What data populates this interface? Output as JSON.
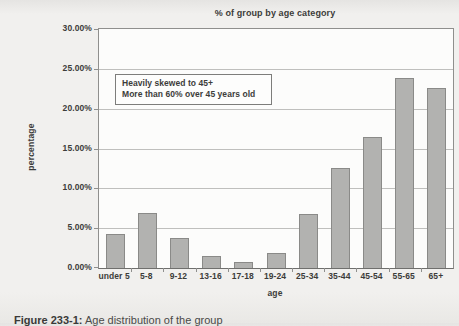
{
  "chart_data": {
    "type": "bar",
    "title": "% of group by age category",
    "xlabel": "age",
    "ylabel": "percentage",
    "categories": [
      "under 5",
      "5-8",
      "9-12",
      "13-16",
      "17-18",
      "19-24",
      "25-34",
      "35-44",
      "45-54",
      "55-65",
      "65+"
    ],
    "values": [
      4.3,
      6.9,
      3.8,
      1.5,
      0.7,
      1.9,
      6.8,
      12.6,
      16.4,
      23.8,
      22.6
    ],
    "y_ticks": [
      "0.00%",
      "5.00%",
      "10.00%",
      "15.00%",
      "20.00%",
      "25.00%",
      "30.00%"
    ],
    "ylim": [
      0,
      30
    ],
    "grid": true,
    "legend": "none",
    "annotation": {
      "line1": "Heavily skewed to 45+",
      "line2": "More than 60% over 45 years old"
    },
    "bar_color": "#b2b2b0",
    "bar_border_color": "#8a8a88",
    "plot_background": "#fcfcfb",
    "page_background": "#f1f0ee"
  },
  "figure_caption": {
    "prefix": "Figure 233-1:",
    "text": "Age distribution of the group"
  }
}
